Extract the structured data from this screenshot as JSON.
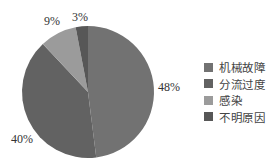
{
  "chart_data": {
    "type": "pie",
    "title": "",
    "categories": [
      "机械故障",
      "分流过度",
      "感染",
      "不明原因"
    ],
    "values": [
      48,
      40,
      9,
      3
    ],
    "labels": [
      "48%",
      "40%",
      "9%",
      "3%"
    ],
    "colors": [
      "#727272",
      "#626262",
      "#9b9b9b",
      "#575757"
    ],
    "start_angle_deg": 0,
    "direction": "clockwise",
    "legend_position": "right"
  },
  "legend": {
    "items": [
      {
        "label": "机械故障",
        "color": "#727272"
      },
      {
        "label": "分流过度",
        "color": "#626262"
      },
      {
        "label": "感染",
        "color": "#9b9b9b"
      },
      {
        "label": "不明原因",
        "color": "#575757"
      }
    ]
  },
  "slice_labels": {
    "s0": "48%",
    "s1": "40%",
    "s2": "9%",
    "s3": "3%"
  }
}
